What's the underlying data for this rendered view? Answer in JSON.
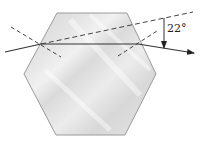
{
  "diagram": {
    "angle_label": "22°",
    "elements": {
      "crystal": {
        "shape": "hexagon",
        "vertices": [
          [
            57,
            13
          ],
          [
            127,
            13
          ],
          [
            156,
            74
          ],
          [
            125,
            135
          ],
          [
            56,
            135
          ],
          [
            24,
            74
          ]
        ],
        "fill": "#dcdcdc",
        "stroke": "#9a9a9a"
      },
      "incident_ray": {
        "from": [
          5,
          52
        ],
        "to": [
          41,
          44
        ],
        "style": "solid"
      },
      "internal_ray": {
        "from": [
          41,
          44
        ],
        "to": [
          138,
          44
        ],
        "style": "solid"
      },
      "exit_ray": {
        "from": [
          138,
          44
        ],
        "to": [
          194,
          53
        ],
        "style": "solid-arrow"
      },
      "incident_extension": {
        "from": [
          41,
          44
        ],
        "to": [
          193,
          12
        ],
        "style": "dashed"
      },
      "entry_normal": {
        "from": [
          11,
          27
        ],
        "to": [
          61,
          57
        ],
        "style": "dashed"
      },
      "exit_normal": {
        "from": [
          118,
          56
        ],
        "to": [
          157,
          31
        ],
        "style": "dashed"
      },
      "deviation_marker": {
        "x": 164,
        "from_y": 18,
        "to_y": 49,
        "style": "arrow-down"
      }
    },
    "colors": {
      "line": "#333333",
      "crystal_fill": "#dcdcdc",
      "crystal_highlight": "#f2f2f2",
      "crystal_stroke": "#9a9a9a"
    }
  }
}
